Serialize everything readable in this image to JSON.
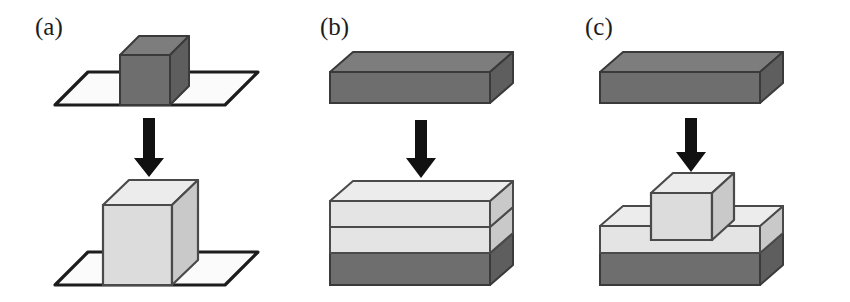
{
  "figure": {
    "width": 850,
    "height": 302,
    "background": "#ffffff",
    "type": "isometric-process-diagram"
  },
  "palette": {
    "outline": "#1d1d1d",
    "arrow": "#111111",
    "dark_top": "#7d7d7d",
    "dark_front": "#6e6e6e",
    "dark_side": "#5e5e5e",
    "light_top": "#e8e8e8",
    "light_front": "#dcdcdc",
    "light_side": "#c9c9c9",
    "plane_fill": "#fbfbfb",
    "background": "#ffffff"
  },
  "panels": [
    {
      "id": "a",
      "label": "(a)",
      "before": {
        "name": "dark-cube-on-plane",
        "shapes": [
          "substrate-plane",
          "dark-cube"
        ],
        "cube_shade": "dark",
        "has_plane": true,
        "layers": 1
      },
      "arrow": {
        "name": "process-arrow",
        "direction": "down"
      },
      "after": {
        "name": "light-cube-on-plane",
        "shapes": [
          "substrate-plane",
          "light-cube"
        ],
        "cube_shade": "light",
        "has_plane": true,
        "layers": 1
      }
    },
    {
      "id": "b",
      "label": "(b)",
      "before": {
        "name": "dark-thin-slab",
        "shapes": [
          "dark-slab"
        ],
        "cube_shade": "dark",
        "has_plane": false,
        "layers": 1
      },
      "arrow": {
        "name": "process-arrow",
        "direction": "down"
      },
      "after": {
        "name": "three-layer-stack",
        "shapes": [
          "dark-base-layer",
          "light-middle-layer",
          "light-top-layer"
        ],
        "cube_shade": "light",
        "has_plane": false,
        "layers": 3
      }
    },
    {
      "id": "c",
      "label": "(c)",
      "before": {
        "name": "dark-thin-slab",
        "shapes": [
          "dark-slab"
        ],
        "cube_shade": "dark",
        "has_plane": false,
        "layers": 1
      },
      "arrow": {
        "name": "process-arrow",
        "direction": "down"
      },
      "after": {
        "name": "light-cube-on-two-layer-slab",
        "shapes": [
          "dark-base-layer",
          "light-top-layer",
          "light-cube"
        ],
        "cube_shade": "light",
        "has_plane": false,
        "layers": 2
      }
    }
  ]
}
